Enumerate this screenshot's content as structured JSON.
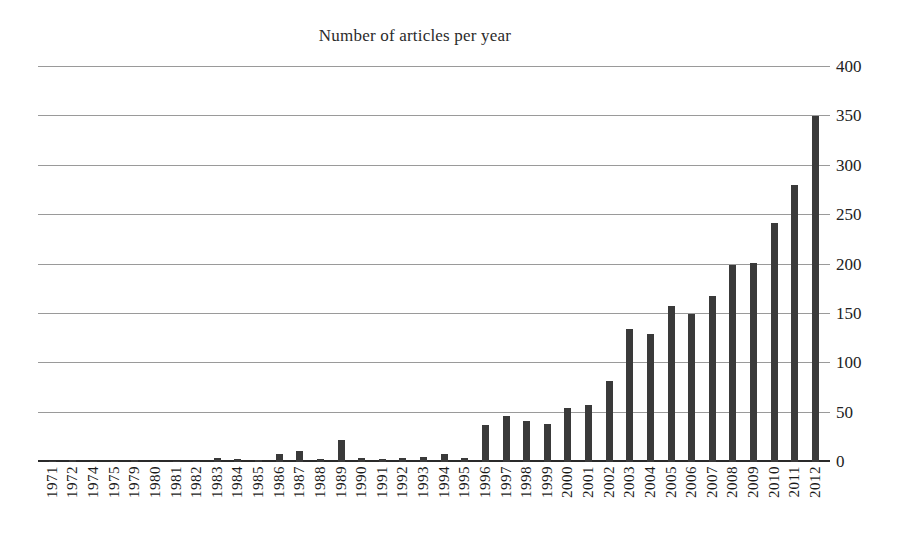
{
  "chart_data": {
    "type": "bar",
    "title": "Number of articles per year",
    "xlabel": "",
    "ylabel": "",
    "ylim": [
      0,
      400
    ],
    "ytick_step": 50,
    "yticks": [
      0,
      50,
      100,
      150,
      200,
      250,
      300,
      350,
      400
    ],
    "y_axis_position": "right",
    "grid": true,
    "legend": false,
    "bar_color": "#3a3a3a",
    "categories": [
      "1971",
      "1972",
      "1974",
      "1975",
      "1979",
      "1980",
      "1981",
      "1982",
      "1983",
      "1984",
      "1985",
      "1986",
      "1987",
      "1988",
      "1989",
      "1990",
      "1991",
      "1992",
      "1993",
      "1994",
      "1995",
      "1996",
      "1997",
      "1998",
      "1999",
      "2000",
      "2001",
      "2002",
      "2003",
      "2004",
      "2005",
      "2006",
      "2007",
      "2008",
      "2009",
      "2010",
      "2011",
      "2012"
    ],
    "values": [
      1,
      2,
      1,
      1,
      2,
      1,
      1,
      1,
      4,
      3,
      2,
      8,
      11,
      3,
      22,
      4,
      3,
      4,
      5,
      8,
      4,
      37,
      47,
      42,
      38,
      55,
      58,
      82,
      135,
      130,
      158,
      150,
      168,
      200,
      202,
      242,
      281,
      350
    ]
  }
}
